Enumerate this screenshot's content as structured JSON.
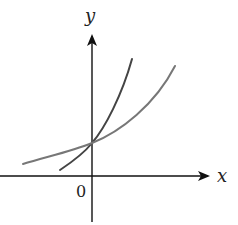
{
  "diagram": {
    "type": "function-graph",
    "axes": {
      "x_label": "x",
      "y_label": "y",
      "origin_label": "0",
      "color": "#111111"
    },
    "curves": [
      {
        "name": "steeper-exponential",
        "description": "steeper increasing exponential curve, passes through the y-intercept",
        "color": "#444444",
        "path": "M 60 170 C 75 160, 85 152, 92 143 C 105 128, 122 95, 132 59"
      },
      {
        "name": "shallower-exponential",
        "description": "shallower increasing exponential curve, passes through the same y-intercept",
        "color": "#777777",
        "path": "M 23 164 C 45 157, 70 152, 92 143 C 120 132, 155 105, 175 66"
      }
    ],
    "intersection": {
      "label": "",
      "x": 92,
      "y": 143
    }
  }
}
